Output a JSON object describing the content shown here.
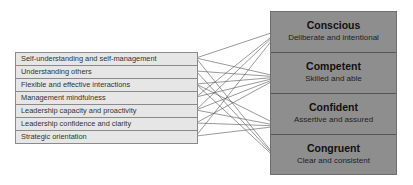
{
  "left_items": [
    {
      "label": "Self-understanding and self-management"
    },
    {
      "label": "Understanding others"
    },
    {
      "label": "Flexible and effective interactions"
    },
    {
      "label": "Management mindfulness"
    },
    {
      "label": "Leadership capacity and proactivity"
    },
    {
      "label": "Leadership confidence and clarity"
    },
    {
      "label": "Strategic orientation"
    }
  ],
  "right_items": [
    {
      "title": "Conscious",
      "subtitle": "Deliberate and intentional"
    },
    {
      "title": "Competent",
      "subtitle": "Skilled and able"
    },
    {
      "title": "Confident",
      "subtitle": "Assertive and assured"
    },
    {
      "title": "Congruent",
      "subtitle": "Clear and consistent"
    }
  ],
  "colors": {
    "left_fill": "#e6e6e6",
    "right_fill": "#8e8e8e",
    "line": "#555555"
  }
}
